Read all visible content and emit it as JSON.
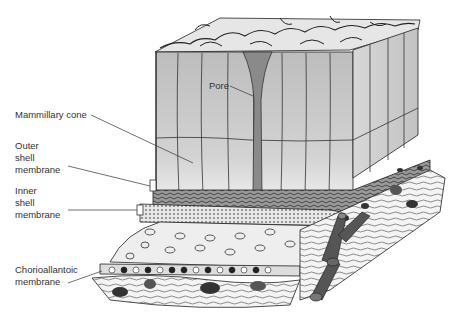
{
  "diagram": {
    "labels": {
      "pore": "Pore",
      "mammillary_cone": "Mammillary cone",
      "outer_shell_membrane": "Outer\nshell\nmembrane",
      "inner_shell_membrane": "Inner\nshell\nmembrane",
      "chorioallantoic_membrane": "Chorioallantoic\nmembrane"
    },
    "colors": {
      "shell_column": "#c9c9c9",
      "shell_top": "#e6e6e6",
      "outline": "#222222",
      "vessel": "#555555",
      "label_text": "#333333"
    }
  }
}
